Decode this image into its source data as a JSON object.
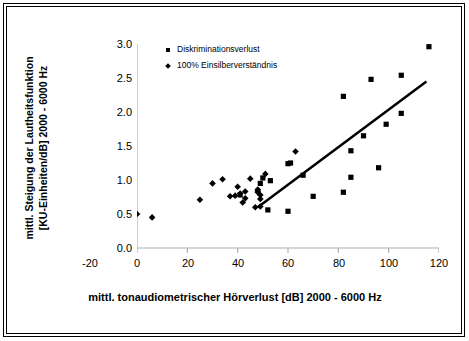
{
  "figure": {
    "border_color": "#000000",
    "background": "#ffffff"
  },
  "legend": {
    "position": "top-left-inside",
    "entries": [
      {
        "label": "Diskriminationsverlust",
        "marker": "square",
        "color": "#000000"
      },
      {
        "label": "100% Einsilberverständnis",
        "marker": "diamond",
        "color": "#000000"
      }
    ]
  },
  "axis": {
    "x_title": "mittl. tonaudiometrischer Hörverlust [dB] 2000 - 6000 Hz",
    "y_title_line1": "mittl. Steigung der Lautheitsfunktion",
    "y_title_line2": "[KU-Einheiten/dB] 2000 - 6000 Hz",
    "x_ticks": [
      "-20",
      "0",
      "20",
      "40",
      "60",
      "80",
      "100",
      "120"
    ],
    "y_ticks": [
      "0.0",
      "0.5",
      "1.0",
      "1.5",
      "2.0",
      "2.5",
      "3.0"
    ]
  },
  "chart_data": {
    "type": "scatter",
    "title": "",
    "xlabel": "mittl. tonaudiometrischer Hörverlust [dB] 2000 - 6000 Hz",
    "ylabel": "mittl. Steigung der Lautheitsfunktion [KU-Einheiten/dB] 2000 - 6000 Hz",
    "xlim": [
      -20,
      120
    ],
    "ylim": [
      0.0,
      3.0
    ],
    "xticks": [
      -20,
      0,
      20,
      40,
      60,
      80,
      100,
      120
    ],
    "yticks": [
      0.0,
      0.5,
      1.0,
      1.5,
      2.0,
      2.5,
      3.0
    ],
    "grid": false,
    "legend_position": "upper left inside",
    "series": [
      {
        "name": "Diskriminationsverlust",
        "marker": "square",
        "color": "#000000",
        "points": [
          [
            41,
            0.78
          ],
          [
            49,
            0.95
          ],
          [
            50,
            1.03
          ],
          [
            52,
            0.56
          ],
          [
            53,
            0.99
          ],
          [
            60,
            0.54
          ],
          [
            60,
            1.24
          ],
          [
            61,
            1.25
          ],
          [
            66,
            1.07
          ],
          [
            70,
            0.76
          ],
          [
            82,
            2.23
          ],
          [
            82,
            0.82
          ],
          [
            85,
            1.04
          ],
          [
            85,
            1.43
          ],
          [
            90,
            1.65
          ],
          [
            93,
            2.48
          ],
          [
            96,
            1.18
          ],
          [
            99,
            1.82
          ],
          [
            105,
            2.54
          ],
          [
            105,
            1.98
          ],
          [
            116,
            2.96
          ]
        ]
      },
      {
        "name": "100% Einsilberverständnis",
        "marker": "diamond",
        "color": "#000000",
        "points": [
          [
            0,
            0.5
          ],
          [
            6,
            0.45
          ],
          [
            25,
            0.71
          ],
          [
            30,
            0.95
          ],
          [
            34,
            1.01
          ],
          [
            37,
            0.76
          ],
          [
            39,
            0.77
          ],
          [
            40,
            0.9
          ],
          [
            41,
            0.8
          ],
          [
            42,
            0.67
          ],
          [
            43,
            0.83
          ],
          [
            43,
            0.73
          ],
          [
            45,
            1.02
          ],
          [
            47,
            0.6
          ],
          [
            48,
            0.84
          ],
          [
            48,
            0.86
          ],
          [
            48,
            0.82
          ],
          [
            49,
            0.78
          ],
          [
            49,
            0.72
          ],
          [
            49,
            0.61
          ],
          [
            51,
            1.09
          ],
          [
            63,
            1.42
          ]
        ]
      }
    ],
    "trendline": {
      "type": "linear",
      "start": [
        48,
        0.6
      ],
      "end": [
        115,
        2.45
      ],
      "color": "#000000",
      "width": 2.5
    }
  }
}
